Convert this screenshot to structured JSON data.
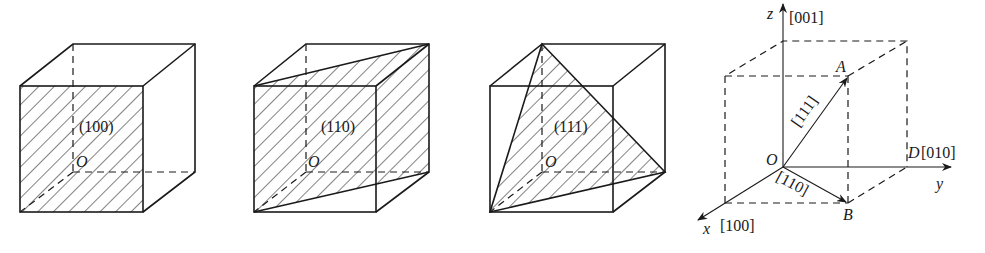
{
  "figure": {
    "cubes": [
      {
        "id": "cube-100",
        "plane_label": "(100)",
        "origin_label": "O",
        "plane": "front-face"
      },
      {
        "id": "cube-110",
        "plane_label": "(110)",
        "origin_label": "O",
        "plane": "diagonal-plane"
      },
      {
        "id": "cube-111",
        "plane_label": "(111)",
        "origin_label": "O",
        "plane": "triangle"
      }
    ],
    "axes_diagram": {
      "origin": "O",
      "z_axis": "z",
      "z_direction": "[001]",
      "y_axis": "y",
      "x_axis": "x",
      "x_direction": "[100]",
      "point_a": "A",
      "point_b": "B",
      "point_d": "D",
      "d_direction": "[010]",
      "vector_oa": "[111]",
      "vector_ob": "[110]"
    }
  },
  "colors": {
    "line": "#1a1a1a",
    "background": "#ffffff"
  }
}
